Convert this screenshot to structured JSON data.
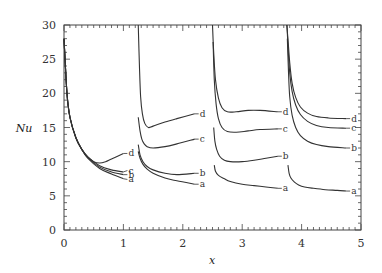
{
  "chart_data": {
    "type": "line",
    "title": "",
    "xlabel": "x",
    "ylabel": "Nu",
    "xlim": [
      0,
      5
    ],
    "ylim": [
      0,
      30
    ],
    "xticks": [
      0,
      1,
      2,
      3,
      4,
      5
    ],
    "yticks": [
      0,
      5,
      10,
      15,
      20,
      25,
      30
    ],
    "grid": false,
    "legend": "inline curve labels a, b, c, d at end of each segment",
    "segments": [
      {
        "name": "segment-1",
        "series": [
          {
            "name": "a",
            "x": [
              0.0,
              0.05,
              0.1,
              0.2,
              0.3,
              0.4,
              0.6,
              0.8,
              1.0
            ],
            "y": [
              28,
              20,
              16.5,
              13.5,
              11.8,
              10.5,
              9.0,
              8.2,
              7.5
            ]
          },
          {
            "name": "b",
            "x": [
              0.0,
              0.05,
              0.1,
              0.2,
              0.3,
              0.4,
              0.6,
              0.8,
              1.0
            ],
            "y": [
              28,
              20,
              16.5,
              13.5,
              11.8,
              10.6,
              9.2,
              8.5,
              8.1
            ]
          },
          {
            "name": "c",
            "x": [
              0.0,
              0.05,
              0.1,
              0.2,
              0.3,
              0.4,
              0.6,
              0.8,
              1.0
            ],
            "y": [
              28,
              20,
              16.5,
              13.5,
              11.8,
              10.7,
              9.4,
              8.8,
              8.5
            ]
          },
          {
            "name": "d",
            "x": [
              0.0,
              0.05,
              0.1,
              0.2,
              0.3,
              0.4,
              0.5,
              0.6,
              0.7,
              0.8,
              1.0
            ],
            "y": [
              28,
              20,
              16.5,
              13.5,
              11.8,
              10.7,
              10.0,
              9.8,
              10.0,
              10.4,
              11.2
            ]
          }
        ]
      },
      {
        "name": "segment-2",
        "series": [
          {
            "name": "a",
            "x": [
              1.25,
              1.28,
              1.33,
              1.4,
              1.5,
              1.7,
              1.9,
              2.2
            ],
            "y": [
              11.5,
              10.5,
              9.6,
              8.9,
              8.3,
              7.6,
              7.2,
              6.7
            ]
          },
          {
            "name": "b",
            "x": [
              1.25,
              1.28,
              1.33,
              1.4,
              1.5,
              1.7,
              1.9,
              2.2
            ],
            "y": [
              12.5,
              11.0,
              10.0,
              9.3,
              8.8,
              8.3,
              8.1,
              8.3
            ]
          },
          {
            "name": "c",
            "x": [
              1.25,
              1.28,
              1.31,
              1.35,
              1.4,
              1.5,
              1.7,
              1.9,
              2.2
            ],
            "y": [
              16.5,
              14.5,
              13.3,
              12.6,
              12.2,
              12.0,
              12.2,
              12.6,
              13.3
            ]
          },
          {
            "name": "d",
            "x": [
              1.25,
              1.27,
              1.29,
              1.32,
              1.36,
              1.42,
              1.5,
              1.7,
              1.9,
              2.2
            ],
            "y": [
              30,
              24,
              19.5,
              17,
              15.6,
              15.0,
              15.2,
              15.8,
              16.3,
              17.0
            ]
          }
        ]
      },
      {
        "name": "segment-3",
        "series": [
          {
            "name": "a",
            "x": [
              2.53,
              2.55,
              2.6,
              2.7,
              2.8,
              3.0,
              3.2,
              3.4,
              3.6
            ],
            "y": [
              9.5,
              8.6,
              8.0,
              7.5,
              7.1,
              6.7,
              6.5,
              6.3,
              6.1
            ]
          },
          {
            "name": "b",
            "x": [
              2.52,
              2.54,
              2.57,
              2.62,
              2.7,
              2.8,
              3.0,
              3.2,
              3.4,
              3.6
            ],
            "y": [
              15.0,
              13.0,
              11.8,
              10.8,
              10.2,
              10.0,
              10.0,
              10.2,
              10.5,
              10.8
            ]
          },
          {
            "name": "c",
            "x": [
              2.51,
              2.53,
              2.56,
              2.6,
              2.66,
              2.75,
              2.9,
              3.1,
              3.3,
              3.6
            ],
            "y": [
              27.5,
              22,
              18.5,
              16.3,
              15.0,
              14.4,
              14.3,
              14.5,
              14.7,
              14.8
            ]
          },
          {
            "name": "d",
            "x": [
              2.5,
              2.52,
              2.55,
              2.6,
              2.66,
              2.75,
              2.9,
              3.1,
              3.3,
              3.6
            ],
            "y": [
              30,
              26,
              22,
              19.3,
              17.9,
              17.3,
              17.3,
              17.5,
              17.5,
              17.3
            ]
          }
        ]
      },
      {
        "name": "segment-4",
        "series": [
          {
            "name": "a",
            "x": [
              3.77,
              3.79,
              3.82,
              3.88,
              3.95,
              4.05,
              4.2,
              4.4,
              4.6,
              4.75
            ],
            "y": [
              9.5,
              8.3,
              7.6,
              7.0,
              6.6,
              6.3,
              6.1,
              5.9,
              5.8,
              5.7
            ]
          },
          {
            "name": "b",
            "x": [
              3.76,
              3.78,
              3.8,
              3.84,
              3.9,
              3.98,
              4.1,
              4.25,
              4.45,
              4.75
            ],
            "y": [
              28,
              23,
              19.5,
              16.8,
              15.0,
              13.8,
              13.0,
              12.5,
              12.2,
              12.0
            ]
          },
          {
            "name": "c",
            "x": [
              3.755,
              3.77,
              3.8,
              3.84,
              3.9,
              3.98,
              4.1,
              4.25,
              4.45,
              4.75
            ],
            "y": [
              30,
              27,
              23,
              20.3,
              18.3,
              16.9,
              15.9,
              15.3,
              15.0,
              14.9
            ]
          },
          {
            "name": "d",
            "x": [
              3.75,
              3.77,
              3.8,
              3.84,
              3.9,
              3.98,
              4.1,
              4.25,
              4.45,
              4.75
            ],
            "y": [
              30,
              28,
              24.5,
              21.5,
              19.4,
              18.0,
              17.1,
              16.6,
              16.4,
              16.3
            ]
          }
        ]
      }
    ],
    "end_labels": [
      {
        "segment": 1,
        "labels": [
          {
            "name": "d",
            "y": 11.2
          },
          {
            "name": "c",
            "y": 8.7
          },
          {
            "name": "b",
            "y": 8.1
          },
          {
            "name": "a",
            "y": 7.4
          }
        ]
      },
      {
        "segment": 2,
        "labels": [
          {
            "name": "d",
            "y": 17.0
          },
          {
            "name": "c",
            "y": 13.3
          },
          {
            "name": "b",
            "y": 8.3
          },
          {
            "name": "a",
            "y": 6.7
          }
        ]
      },
      {
        "segment": 3,
        "labels": [
          {
            "name": "d",
            "y": 17.3
          },
          {
            "name": "c",
            "y": 14.8
          },
          {
            "name": "b",
            "y": 10.8
          },
          {
            "name": "a",
            "y": 6.1
          }
        ]
      },
      {
        "segment": 4,
        "labels": [
          {
            "name": "d",
            "y": 16.3
          },
          {
            "name": "c",
            "y": 14.9
          },
          {
            "name": "b",
            "y": 12.0
          },
          {
            "name": "a",
            "y": 5.7
          }
        ]
      }
    ]
  },
  "axes": {
    "xlabel": "x",
    "ylabel": "Nu"
  },
  "colors": {
    "line": "#333333",
    "axis": "#444444",
    "background": "#ffffff"
  }
}
